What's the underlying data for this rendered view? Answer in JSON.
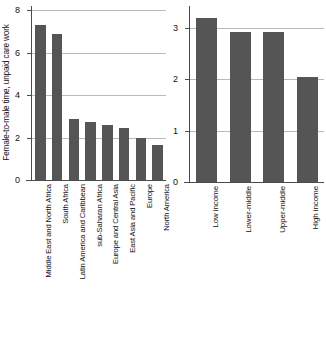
{
  "chart_data": [
    {
      "id": "left",
      "type": "bar",
      "title": "",
      "xlabel": "",
      "ylabel": "Female-to-male time, unpaid care work",
      "ylim": [
        0,
        8
      ],
      "yticks": [
        0,
        2,
        4,
        6,
        8
      ],
      "ytick_labels": [
        "0",
        "2",
        "4",
        "6",
        "8"
      ],
      "grid": true,
      "legend": "none",
      "bar_color": "#555555",
      "categories": [
        "Middle East and North Africa",
        "South Africa",
        "Latin America and Caribbean",
        "sub-Saharan Africa",
        "Europe and Central Asia",
        "East Asia and Pacific",
        "Europe",
        "North America"
      ],
      "values": [
        7.3,
        6.85,
        2.85,
        2.75,
        2.6,
        2.45,
        2.0,
        1.65
      ]
    },
    {
      "id": "right",
      "type": "bar",
      "title": "",
      "xlabel": "",
      "ylabel": "",
      "ylim": [
        0,
        3.35
      ],
      "yticks": [
        1,
        2,
        3
      ],
      "ytick_labels": [
        "1",
        "2",
        "3"
      ],
      "zero_label": "0",
      "grid": true,
      "legend": "none",
      "bar_color": "#555555",
      "categories": [
        "Low income",
        "Lower-middle",
        "Upper-middle",
        "High income"
      ],
      "values": [
        3.2,
        2.93,
        2.92,
        2.05
      ]
    }
  ]
}
